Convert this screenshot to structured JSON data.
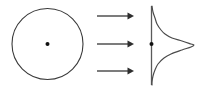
{
  "figure": {
    "title": "",
    "width": 204,
    "height": 92,
    "background_color": "#ffffff",
    "stroke_color": "#3a3a3a",
    "accent_color": "#111111"
  },
  "chart_data": {
    "type": "line",
    "title": "",
    "subtitle": "",
    "xlabel": "",
    "ylabel": "",
    "grid": false,
    "legend_position": "none",
    "panels": [
      {
        "name": "source-circle",
        "shape": "circle",
        "center": [
          47.5,
          44
        ],
        "radius": 35.5,
        "stroke_color": "#3a3a3a",
        "fill": "none",
        "center_marker": {
          "name": "center-dot",
          "position": [
            47.5,
            44
          ],
          "radius": 2.0,
          "color": "#111111"
        }
      },
      {
        "name": "projection-rays",
        "shape": "arrows",
        "direction": "right",
        "count": 3,
        "arrows": [
          {
            "label": "ray-top",
            "x_start": 97,
            "x_end": 134,
            "y": 16
          },
          {
            "label": "ray-middle",
            "x_start": 97,
            "x_end": 134,
            "y": 44
          },
          {
            "label": "ray-bottom",
            "x_start": 97,
            "x_end": 134,
            "y": 71
          }
        ],
        "color": "#2e2e2e"
      },
      {
        "name": "projection-profile",
        "shape": "curve",
        "axis": {
          "name": "vertical-axis",
          "x": 151.5,
          "y_top": 6,
          "y_bottom": 85,
          "color": "#5a5a5a"
        },
        "axis_marker": {
          "name": "profile-center-dot",
          "position": [
            151.5,
            44
          ],
          "radius": 2.0,
          "color": "#111111"
        },
        "peak": {
          "x": 194,
          "y": 45
        },
        "baseline_x": 151.5,
        "stroke_color": "#4a4a4a",
        "y": [
          6,
          12,
          18,
          24,
          30,
          34,
          38,
          41,
          44,
          45,
          47,
          50,
          54,
          58,
          64,
          70,
          76,
          82,
          85
        ],
        "profile_x": [
          152,
          153,
          155,
          157,
          161,
          165,
          172,
          182,
          191,
          194,
          191,
          182,
          171,
          164,
          158,
          155,
          153,
          152,
          152
        ]
      }
    ]
  }
}
